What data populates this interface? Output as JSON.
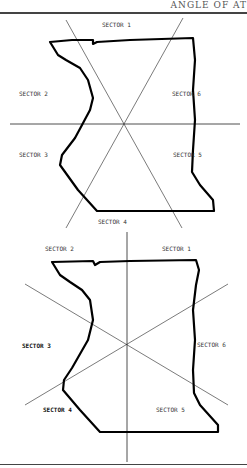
{
  "header": {
    "title": "ANGLE OF AT"
  },
  "figures": [
    {
      "name": "figure-top",
      "labels": [
        "SECTOR 1",
        "SECTOR 2",
        "SECTOR 6",
        "SECTOR 3",
        "SECTOR 5",
        "SECTOR 4"
      ]
    },
    {
      "name": "figure-bottom",
      "labels": [
        "SECTOR 2",
        "SECTOR 1",
        "SECTOR 3",
        "SECTOR 6",
        "SECTOR 4",
        "SECTOR 5"
      ]
    }
  ]
}
